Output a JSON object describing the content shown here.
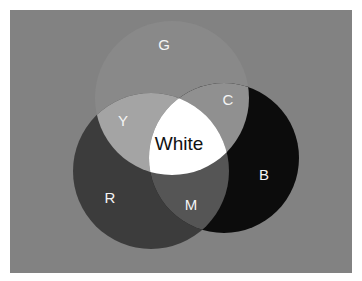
{
  "diagram": {
    "type": "venn-additive-color",
    "background_color": "#828282",
    "circles": [
      {
        "id": "G",
        "label": "G",
        "cx": 172,
        "cy": 98,
        "r": 77,
        "fill": "#898989"
      },
      {
        "id": "R",
        "label": "R",
        "cx": 151,
        "cy": 171,
        "r": 78,
        "fill": "#3c3c3c"
      },
      {
        "id": "B",
        "label": "B",
        "cx": 224,
        "cy": 158,
        "r": 75,
        "fill": "#0c0c0c"
      }
    ],
    "overlaps": {
      "Y": {
        "label": "Y",
        "fill": "#a4a4a4"
      },
      "C": {
        "label": "C",
        "fill": "#909090"
      },
      "M": {
        "label": "M",
        "fill": "#555555"
      },
      "White": {
        "label": "White",
        "fill": "#ffffff"
      }
    },
    "labels": {
      "G": "G",
      "Y": "Y",
      "C": "C",
      "White": "White",
      "R": "R",
      "M": "M",
      "B": "B"
    }
  }
}
